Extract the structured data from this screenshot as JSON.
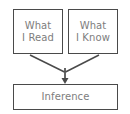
{
  "diagram": {
    "background_color": "#ffffff",
    "border_color": "#4a4a4a",
    "text_color": "#7d7d7d",
    "connector_color": "#4a4a4a",
    "nodes": [
      {
        "id": "what-i-read",
        "label": "What\nI Read",
        "role": "source"
      },
      {
        "id": "what-i-know",
        "label": "What\nI Know",
        "role": "source"
      },
      {
        "id": "inference",
        "label": "Inference",
        "role": "result"
      }
    ],
    "connectors": [
      {
        "id": "read-to-merge",
        "from": "what-i-read",
        "to": "inference",
        "style": "line"
      },
      {
        "id": "know-to-merge",
        "from": "what-i-know",
        "to": "inference",
        "style": "line"
      },
      {
        "id": "merge-to-inference",
        "from": "merge-point",
        "to": "inference",
        "style": "arrow-down"
      }
    ]
  }
}
